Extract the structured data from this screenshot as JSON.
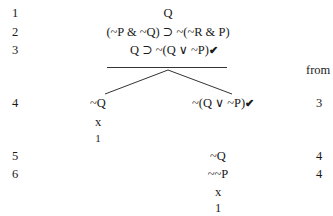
{
  "tree": {
    "header_from": "from",
    "lines": [
      {
        "num": "1",
        "formula": "Q",
        "from": ""
      },
      {
        "num": "2",
        "formula": "(~P & ~Q) ⊃ ~(~R & P)",
        "from": ""
      },
      {
        "num": "3",
        "formula": "Q ⊃ ~(Q ∨ ~P)",
        "checked": true,
        "from": ""
      },
      {
        "num": "4",
        "left": "~Q",
        "right": "~(Q ∨ ~P)",
        "right_checked": true,
        "from": "3"
      },
      {
        "num": "5",
        "right": "~Q",
        "from": "4"
      },
      {
        "num": "6",
        "right": "~~P",
        "from": "4"
      }
    ],
    "left_branch": {
      "close_mark": "x",
      "close_ref": "1"
    },
    "right_branch": {
      "close_mark": "x",
      "close_ref": "1"
    },
    "check_mark": "✔"
  }
}
